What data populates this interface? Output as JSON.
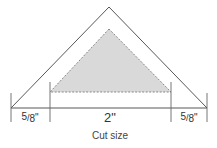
{
  "diagram": {
    "type": "quilting-triangle-cut-size",
    "colors": {
      "line": "#444444",
      "shaded_fill": "#d9d9d9",
      "dashed_edge": "#888888"
    },
    "dimensions": {
      "left_seam": "5/8\"",
      "finished_width": "2\"",
      "right_seam": "5/8\""
    },
    "left_seam_parts": {
      "numerator": "5",
      "denominator": "8",
      "unit": "\""
    },
    "right_seam_parts": {
      "numerator": "5",
      "denominator": "8",
      "unit": "\""
    },
    "caption": "Cut size"
  }
}
